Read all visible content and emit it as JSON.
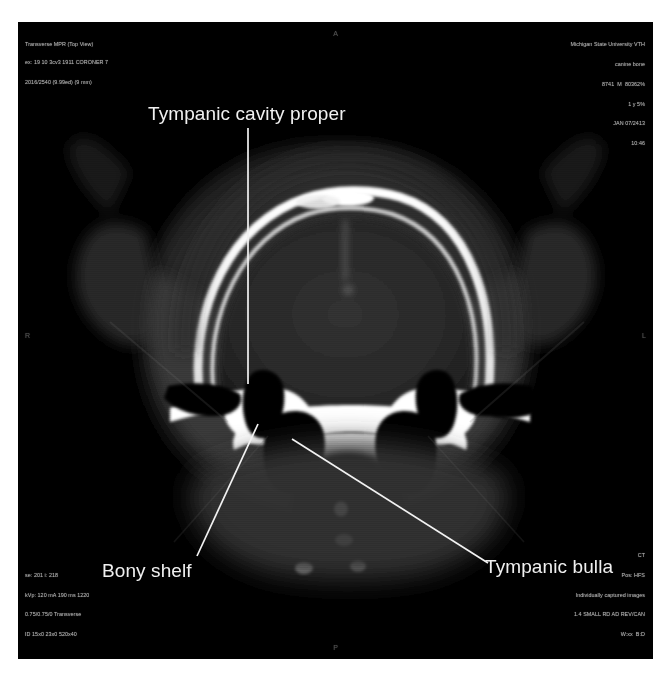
{
  "image": {
    "modality": "CT",
    "view_title": "Transverse MPR (Top View)",
    "description": "Transverse CT image of a canine skull at the level of the tympanic bullae"
  },
  "metadata": {
    "top_left": {
      "line1": "Transverse MPR (Top View)",
      "line2": "ex: 19 10 3cv3 1911 CORONER 7",
      "line3": "2016/2540 (9.99ed) (9 mm)"
    },
    "top_right": {
      "line1": "Michigan State University VTH",
      "line2": "canine bone",
      "line3": "8741  M  80362%",
      "line4": "1 y 5%",
      "line5": "JAN 07/2413",
      "line6": "10:46"
    },
    "bottom_left": {
      "line1": "se: 201 i: 218",
      "line2": "kVp: 120 mA 190 ms 1220",
      "line3": "0.75/0.75/0 Transverse",
      "line4": "ID 15x0 23x0 520x40"
    },
    "bottom_right": {
      "line1": "CT",
      "line2": "Pos: HFS",
      "line3": "Individually captured images",
      "line4": "1.4 SMALL RD AD REV/CAN",
      "line5": "W:xx  B:D"
    }
  },
  "orientation_markers": {
    "left": "R",
    "right": "L",
    "top": "A",
    "bottom": "P"
  },
  "annotations": [
    {
      "id": "tympanic-cavity-proper",
      "label": "Tympanic cavity proper",
      "leader": {
        "x1": 248,
        "y1": 128,
        "x2": 248,
        "y2": 384
      }
    },
    {
      "id": "bony-shelf",
      "label": "Bony shelf",
      "leader": {
        "x1": 197,
        "y1": 556,
        "x2": 258,
        "y2": 424
      }
    },
    {
      "id": "tympanic-bulla",
      "label": "Tympanic bulla",
      "leader": {
        "x1": 292,
        "y1": 439,
        "x2": 488,
        "y2": 563
      }
    }
  ],
  "colors": {
    "background": "#ffffff",
    "viewport": "#000000",
    "annotation_text": "#f0f0f0",
    "leader_line": "#f2f2f2",
    "metadata_text": "#b9b9b9",
    "bone_bright": "#ffffff",
    "soft_tissue": "#3a3a3a",
    "air_cavity": "#000000"
  }
}
